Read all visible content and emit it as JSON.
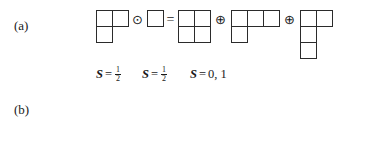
{
  "figure": {
    "kind": "young-tableaux-tensor-product-decomposition",
    "operators": {
      "tensor": "⊙",
      "direct_sum": "⊕",
      "equals": "="
    },
    "rows": [
      {
        "id": "a",
        "label": "(a)",
        "terms": [
          {
            "role": "factor",
            "shape": [
              2,
              1
            ]
          },
          {
            "role": "factor",
            "shape": [
              1
            ]
          },
          {
            "role": "product",
            "shape": [
              2,
              2
            ]
          },
          {
            "role": "product",
            "shape": [
              3,
              1
            ]
          },
          {
            "role": "product",
            "shape": [
              2,
              1,
              1
            ]
          }
        ],
        "spins": [
          {
            "symbol": "S",
            "relation": "=",
            "value": "1/2",
            "numerator": "1",
            "denominator": "2",
            "display": "S = 1/2"
          },
          {
            "symbol": "S",
            "relation": "=",
            "value": "1/2",
            "numerator": "1",
            "denominator": "2",
            "display": "S = 1/2"
          },
          {
            "symbol": "S",
            "relation": "=",
            "value": "0, 1",
            "display": "S = 0, 1"
          }
        ]
      },
      {
        "id": "b",
        "label": "(b)",
        "terms": [
          {
            "role": "factor",
            "shape": [
              3
            ]
          },
          {
            "role": "factor",
            "shape": [
              1
            ]
          },
          {
            "role": "product",
            "shape": [
              4
            ]
          },
          {
            "role": "product",
            "shape": [
              3,
              1
            ]
          }
        ],
        "spins": [
          {
            "symbol": "S",
            "relation": "=",
            "value": "3/2",
            "numerator": "3",
            "denominator": "2",
            "display": "S = 3/2"
          },
          {
            "symbol": "S",
            "relation": "=",
            "value": "1/2",
            "numerator": "1",
            "denominator": "2",
            "display": "S = 1/2"
          },
          {
            "symbol": "S",
            "relation": "=",
            "value": "2, 1",
            "display": "S = 2, 1"
          }
        ]
      }
    ],
    "colors": {
      "ink": "#1a1a1a",
      "box_stroke": "#2b2b2b",
      "background": "#ffffff"
    }
  }
}
